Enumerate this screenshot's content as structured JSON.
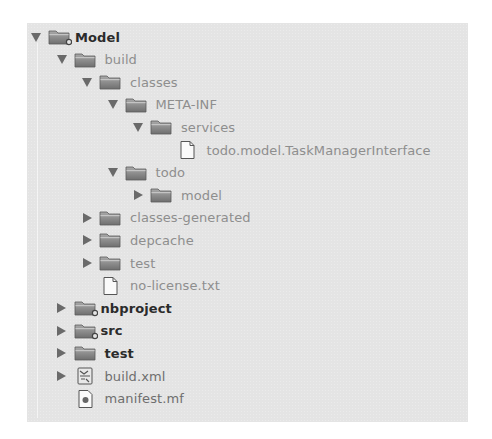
{
  "tree": {
    "items": [
      {
        "label": "Model",
        "depth": 0,
        "expanded": true,
        "type": "project-folder",
        "badge": true,
        "style": "bold"
      },
      {
        "label": "build",
        "depth": 1,
        "expanded": true,
        "type": "folder",
        "style": "dim"
      },
      {
        "label": "classes",
        "depth": 2,
        "expanded": true,
        "type": "folder",
        "style": "dim"
      },
      {
        "label": "META-INF",
        "depth": 3,
        "expanded": true,
        "type": "folder",
        "style": "dim"
      },
      {
        "label": "services",
        "depth": 4,
        "expanded": true,
        "type": "folder",
        "style": "dim"
      },
      {
        "label": "todo.model.TaskManagerInterface",
        "depth": 5,
        "type": "file",
        "style": "dim"
      },
      {
        "label": "todo",
        "depth": 3,
        "expanded": true,
        "type": "folder",
        "style": "dim"
      },
      {
        "label": "model",
        "depth": 4,
        "expanded": false,
        "type": "folder",
        "style": "dim"
      },
      {
        "label": "classes-generated",
        "depth": 2,
        "expanded": false,
        "type": "folder",
        "style": "dim"
      },
      {
        "label": "depcache",
        "depth": 2,
        "expanded": false,
        "type": "folder",
        "style": "dim"
      },
      {
        "label": "test",
        "depth": 2,
        "expanded": false,
        "type": "folder",
        "style": "dim"
      },
      {
        "label": "no-license.txt",
        "depth": 2,
        "type": "file",
        "style": "dim"
      },
      {
        "label": "nbproject",
        "depth": 1,
        "expanded": false,
        "type": "project-folder",
        "badge": true,
        "style": "bold"
      },
      {
        "label": "src",
        "depth": 1,
        "expanded": false,
        "type": "project-folder",
        "badge": true,
        "style": "bold"
      },
      {
        "label": "test",
        "depth": 1,
        "expanded": false,
        "type": "folder",
        "style": "bold"
      },
      {
        "label": "build.xml",
        "depth": 1,
        "expanded": false,
        "type": "ant-file",
        "style": "mid"
      },
      {
        "label": "manifest.mf",
        "depth": 1,
        "type": "manifest-file",
        "style": "mid"
      }
    ]
  },
  "colors": {
    "panel_bg": "#e4e4e4",
    "arrow": "#6a6a6a",
    "folder": "#8a8a8a",
    "bold_text": "#2b2b2b",
    "dim_text": "#8e8e8e"
  }
}
